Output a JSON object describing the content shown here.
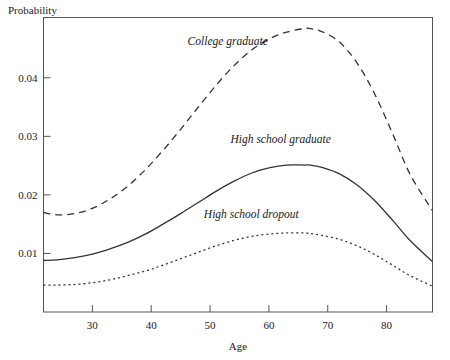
{
  "chart_data": {
    "type": "line",
    "title": "",
    "xlabel": "Age",
    "ylabel": "Probability",
    "xlim": [
      21.7,
      87.8
    ],
    "ylim": [
      0.0,
      0.0503
    ],
    "grid": false,
    "legend_position": "inline-annotations",
    "xticks": [
      30,
      40,
      50,
      60,
      70,
      80
    ],
    "xtick_labels": [
      "30",
      "40",
      "50",
      "60",
      "70",
      "80"
    ],
    "yticks": [
      0.01,
      0.02,
      0.03,
      0.04
    ],
    "ytick_labels": [
      "0.01",
      "0.02",
      "0.03",
      "0.04"
    ],
    "series": [
      {
        "name": "College graduate",
        "style": "dashed",
        "label_x": 53,
        "label_y": 0.0456,
        "peak_x": 67,
        "peak_y": 0.0484,
        "x": [
          21.7,
          24,
          27,
          30,
          33,
          36,
          39,
          42,
          45,
          48,
          51,
          54,
          57,
          60,
          63,
          66,
          67,
          69,
          72,
          75,
          78,
          81,
          84,
          87.8
        ],
        "values": [
          0.017,
          0.0166,
          0.0168,
          0.0177,
          0.0193,
          0.0215,
          0.0243,
          0.0276,
          0.0312,
          0.035,
          0.0387,
          0.042,
          0.0447,
          0.0466,
          0.0478,
          0.0484,
          0.0484,
          0.0479,
          0.0461,
          0.0425,
          0.0372,
          0.0305,
          0.0235,
          0.0173
        ]
      },
      {
        "name": "High school graduate",
        "style": "solid",
        "label_x": 62,
        "label_y": 0.0289,
        "peak_x": 67,
        "peak_y": 0.0251,
        "x": [
          21.7,
          24,
          27,
          30,
          33,
          36,
          39,
          42,
          45,
          48,
          51,
          54,
          57,
          60,
          63,
          66,
          67,
          69,
          72,
          75,
          78,
          81,
          84,
          87.8
        ],
        "values": [
          0.0088,
          0.0089,
          0.0093,
          0.0099,
          0.0108,
          0.0119,
          0.0133,
          0.015,
          0.0168,
          0.0187,
          0.0206,
          0.0223,
          0.0237,
          0.0246,
          0.0251,
          0.0251,
          0.0251,
          0.0247,
          0.0236,
          0.0217,
          0.019,
          0.0157,
          0.0122,
          0.0086
        ]
      },
      {
        "name": "High school dropout",
        "style": "dotted",
        "label_x": 57,
        "label_y": 0.016,
        "peak_x": 66,
        "peak_y": 0.0135,
        "x": [
          21.7,
          24,
          27,
          30,
          33,
          36,
          39,
          42,
          45,
          48,
          51,
          54,
          57,
          60,
          63,
          66,
          67,
          69,
          72,
          75,
          78,
          81,
          84,
          87.8
        ],
        "values": [
          0.0046,
          0.0046,
          0.0047,
          0.005,
          0.0055,
          0.0062,
          0.007,
          0.008,
          0.0091,
          0.0102,
          0.0113,
          0.0122,
          0.0129,
          0.0133,
          0.0135,
          0.0135,
          0.0134,
          0.0131,
          0.0124,
          0.0113,
          0.0098,
          0.008,
          0.0062,
          0.0044
        ]
      }
    ]
  },
  "axes": {
    "y_axis_title": "Probability",
    "x_axis_title": "Age"
  }
}
